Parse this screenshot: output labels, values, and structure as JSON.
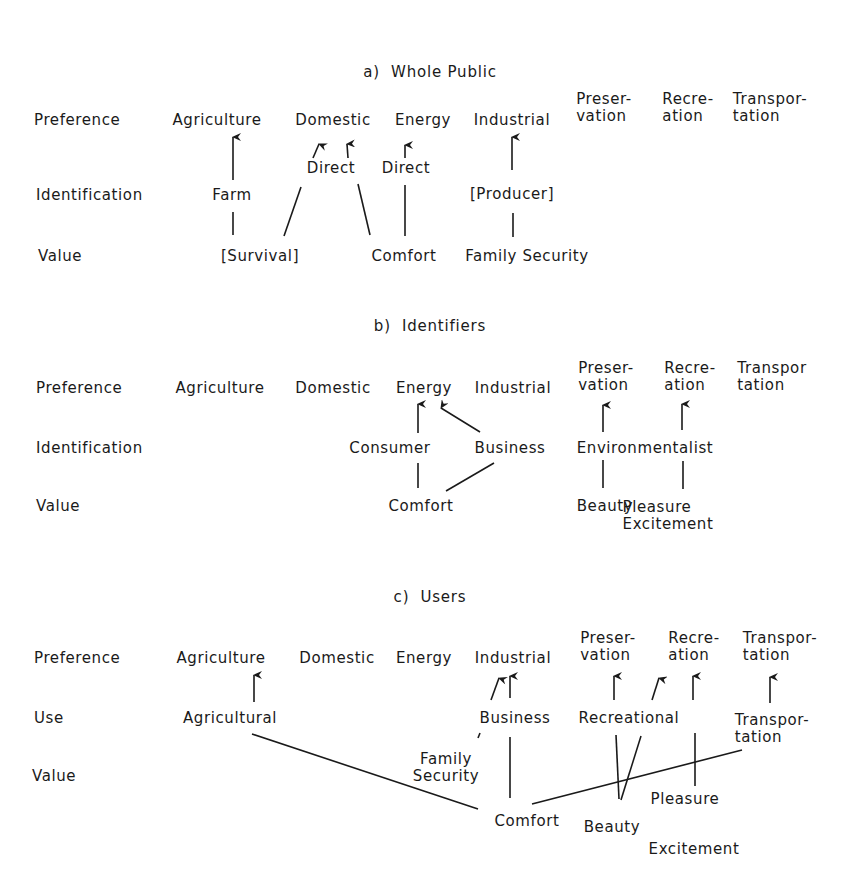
{
  "panels": [
    {
      "id": "a",
      "title": "a)  Whole Public",
      "row_labels": [
        "Preference",
        "Identification",
        "Value"
      ],
      "preferences": [
        "Agriculture",
        "Domestic",
        "Energy",
        "Industrial",
        "Preser-\nvation",
        "Recre-\nation",
        "Transpor-\ntation"
      ],
      "identifications": [
        "Farm",
        "Direct",
        "Direct",
        "[Producer]"
      ],
      "values": [
        "[Survival]",
        "Comfort",
        "Family Security"
      ]
    },
    {
      "id": "b",
      "title": "b)  Identifiers",
      "row_labels": [
        "Preference",
        "Identification",
        "Value"
      ],
      "preferences": [
        "Agriculture",
        "Domestic",
        "Energy",
        "Industrial",
        "Preser-\nvation",
        "Recre-\nation",
        "Transpor\ntation"
      ],
      "identifications": [
        "Consumer",
        "Business",
        "Environmentalist"
      ],
      "values": [
        "Comfort",
        "Beauty",
        "Pleasure\nExcitement"
      ]
    },
    {
      "id": "c",
      "title": "c)  Users",
      "row_labels": [
        "Preference",
        "Use",
        "Value"
      ],
      "preferences": [
        "Agriculture",
        "Domestic",
        "Energy",
        "Industrial",
        "Preser-\nvation",
        "Recre-\nation",
        "Transpor-\ntation"
      ],
      "uses": [
        "Agricultural",
        "Business",
        "Recreational",
        "Transpor-\ntation"
      ],
      "values": [
        "Family\nSecurity",
        "Comfort",
        "Beauty",
        "Pleasure",
        "Excitement"
      ]
    }
  ]
}
